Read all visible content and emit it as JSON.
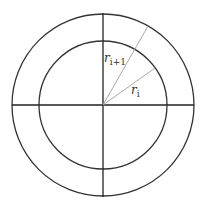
{
  "diagram": {
    "type": "concentric-circles-annulus",
    "center": {
      "x": 103,
      "y": 105
    },
    "inner_circle": {
      "radius": 64
    },
    "outer_circle": {
      "radius": 91
    },
    "axes": {
      "horizontal": true,
      "vertical": true
    },
    "rays": [
      {
        "name": "ray-outer",
        "end": {
          "x": 148,
          "y": 26
        }
      },
      {
        "name": "ray-inner",
        "end": {
          "x": 155,
          "y": 68
        }
      }
    ],
    "labels": {
      "outer_radius": {
        "base": "r",
        "subscript": "i+1"
      },
      "inner_radius": {
        "base": "r",
        "subscript": "i"
      }
    },
    "colors": {
      "circle_stroke": "#333333",
      "axis_stroke": "#222222",
      "ray_stroke": "#aaaaaa",
      "background": "#ffffff"
    }
  }
}
